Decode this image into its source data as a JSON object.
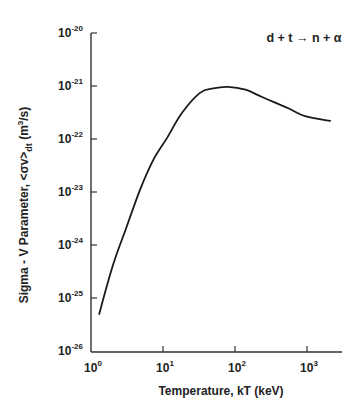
{
  "chart_data": {
    "type": "line",
    "title": "",
    "annotation": {
      "reactants": "d + t",
      "arrow": "→",
      "products": "n + α",
      "full_text": "d + t → n + α"
    },
    "xlabel": "Temperature, kT (keV)",
    "ylabel": "Sigma - V Parameter, <σv>dt (m3/s)",
    "ylabel_parts": {
      "main": "Sigma - V Parameter, <σv>",
      "subscript": "dt",
      "unit_pre": " (m",
      "unit_sup": "3",
      "unit_post": "/s)"
    },
    "xscale": "log",
    "yscale": "log",
    "xlim": [
      1,
      3000
    ],
    "ylim": [
      1e-26,
      1e-20
    ],
    "grid": false,
    "legend": null,
    "x_ticks": [
      {
        "value": 1,
        "base": "10",
        "exp": "0"
      },
      {
        "value": 10,
        "base": "10",
        "exp": "1"
      },
      {
        "value": 100,
        "base": "10",
        "exp": "2"
      },
      {
        "value": 1000,
        "base": "10",
        "exp": "3"
      }
    ],
    "y_ticks": [
      {
        "value": 1e-20,
        "base": "10",
        "exp": "-20"
      },
      {
        "value": 1e-21,
        "base": "10",
        "exp": "-21"
      },
      {
        "value": 1e-22,
        "base": "10",
        "exp": "-22"
      },
      {
        "value": 1e-23,
        "base": "10",
        "exp": "-23"
      },
      {
        "value": 1e-24,
        "base": "10",
        "exp": "-24"
      },
      {
        "value": 1e-25,
        "base": "10",
        "exp": "-25"
      },
      {
        "value": 1e-26,
        "base": "10",
        "exp": "-26"
      }
    ],
    "series": [
      {
        "name": "d + t → n + α",
        "x": [
          1.3,
          2.0,
          3.0,
          4.8,
          7.3,
          11.4,
          18.3,
          32.6,
          50,
          80,
          140,
          238,
          550,
          935,
          2090
        ],
        "y": [
          5e-26,
          4e-25,
          1.9e-24,
          1.1e-23,
          4e-23,
          1.05e-22,
          3.1e-22,
          7.4e-22,
          9e-22,
          9.6e-22,
          8.5e-22,
          6.2e-22,
          3.8e-22,
          2.7e-22,
          2.2e-22
        ]
      }
    ],
    "colors": {
      "line": "#1a1a1a",
      "axis": "#333333",
      "background": "#ffffff"
    }
  }
}
